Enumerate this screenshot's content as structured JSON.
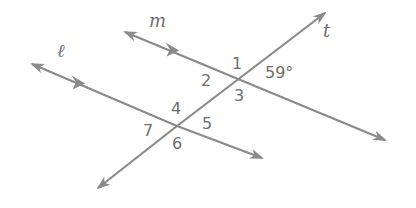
{
  "diagram": {
    "type": "parallel-lines-cut-by-transversal",
    "line_color": "#8a8a8a",
    "text_color": "#6e6e6e",
    "lines": {
      "m": {
        "label": "m",
        "x1": 125,
        "y1": 32,
        "x2": 385,
        "y2": 140,
        "parallel_mark": {
          "x": 172,
          "y": 51
        }
      },
      "l": {
        "label": "ℓ",
        "x1": 32,
        "y1": 64,
        "x2": 262,
        "y2": 158,
        "parallel_mark": {
          "x": 78,
          "y": 83
        }
      },
      "t": {
        "label": "t",
        "x1": 98,
        "y1": 188,
        "x2": 325,
        "y2": 13
      }
    },
    "angles": [
      {
        "id": "1",
        "label": "1"
      },
      {
        "id": "2",
        "label": "2"
      },
      {
        "id": "3",
        "label": "3"
      },
      {
        "id": "4",
        "label": "4"
      },
      {
        "id": "5",
        "label": "5"
      },
      {
        "id": "6",
        "label": "6"
      },
      {
        "id": "7",
        "label": "7"
      }
    ],
    "given_angle": {
      "label": "59°",
      "value": 59
    }
  }
}
